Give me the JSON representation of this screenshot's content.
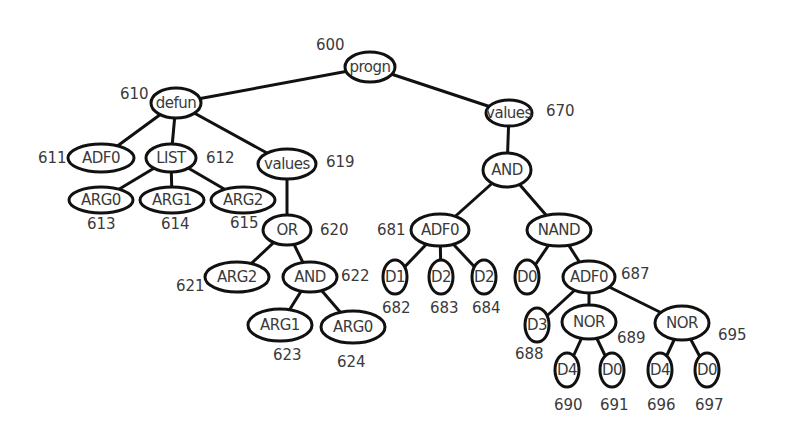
{
  "diagram": {
    "type": "tree",
    "nodes": [
      {
        "id": "n600",
        "label": "progn",
        "ref": "600",
        "x": 370,
        "y": 67,
        "rx": 25,
        "ry": 15,
        "ref_x": 316,
        "ref_y": 45
      },
      {
        "id": "n610",
        "label": "defun",
        "ref": "610",
        "x": 176,
        "y": 103,
        "rx": 25,
        "ry": 15,
        "ref_x": 120,
        "ref_y": 94
      },
      {
        "id": "n611",
        "label": "ADF0",
        "ref": "611",
        "x": 101,
        "y": 158,
        "rx": 33,
        "ry": 14,
        "ref_x": 38,
        "ref_y": 158
      },
      {
        "id": "n612",
        "label": "LIST",
        "ref": "612",
        "x": 171,
        "y": 158,
        "rx": 25,
        "ry": 14,
        "ref_x": 206,
        "ref_y": 158
      },
      {
        "id": "n613",
        "label": "ARG0",
        "ref": "613",
        "x": 101,
        "y": 200,
        "rx": 32,
        "ry": 13,
        "ref_x": 87,
        "ref_y": 224
      },
      {
        "id": "n614",
        "label": "ARG1",
        "ref": "614",
        "x": 172,
        "y": 200,
        "rx": 32,
        "ry": 13,
        "ref_x": 161,
        "ref_y": 224
      },
      {
        "id": "n615",
        "label": "ARG2",
        "ref": "615",
        "x": 243,
        "y": 200,
        "rx": 32,
        "ry": 13,
        "ref_x": 230,
        "ref_y": 223
      },
      {
        "id": "n619",
        "label": "values",
        "ref": "619",
        "x": 287,
        "y": 164,
        "rx": 29,
        "ry": 15,
        "ref_x": 326,
        "ref_y": 162
      },
      {
        "id": "n620",
        "label": "OR",
        "ref": "620",
        "x": 287,
        "y": 230,
        "rx": 24,
        "ry": 15,
        "ref_x": 320,
        "ref_y": 230
      },
      {
        "id": "n621",
        "label": "ARG2",
        "ref": "621",
        "x": 237,
        "y": 277,
        "rx": 32,
        "ry": 15,
        "ref_x": 176,
        "ref_y": 286
      },
      {
        "id": "n622",
        "label": "AND",
        "ref": "622",
        "x": 310,
        "y": 277,
        "rx": 27,
        "ry": 15,
        "ref_x": 341,
        "ref_y": 276
      },
      {
        "id": "n623",
        "label": "ARG1",
        "ref": "623",
        "x": 280,
        "y": 325,
        "rx": 32,
        "ry": 16,
        "ref_x": 273,
        "ref_y": 355
      },
      {
        "id": "n624",
        "label": "ARG0",
        "ref": "624",
        "x": 353,
        "y": 327,
        "rx": 32,
        "ry": 16,
        "ref_x": 337,
        "ref_y": 362
      },
      {
        "id": "n670",
        "label": "values",
        "ref": "670",
        "x": 509,
        "y": 113,
        "rx": 23,
        "ry": 13,
        "ref_x": 546,
        "ref_y": 111
      },
      {
        "id": "n680",
        "label": "AND",
        "ref": "",
        "x": 507,
        "y": 170,
        "rx": 24,
        "ry": 17,
        "ref_x": 0,
        "ref_y": 0
      },
      {
        "id": "n681",
        "label": "ADF0",
        "ref": "681",
        "x": 440,
        "y": 230,
        "rx": 29,
        "ry": 16,
        "ref_x": 377,
        "ref_y": 230
      },
      {
        "id": "n682",
        "label": "D1",
        "ref": "682",
        "x": 395,
        "y": 277,
        "rx": 12,
        "ry": 17,
        "ref_x": 382,
        "ref_y": 308
      },
      {
        "id": "n683",
        "label": "D2",
        "ref": "683",
        "x": 441,
        "y": 277,
        "rx": 12,
        "ry": 17,
        "ref_x": 430,
        "ref_y": 308
      },
      {
        "id": "n684",
        "label": "D2",
        "ref": "684",
        "x": 484,
        "y": 277,
        "rx": 12,
        "ry": 17,
        "ref_x": 472,
        "ref_y": 308
      },
      {
        "id": "n685",
        "label": "NAND",
        "ref": "",
        "x": 559,
        "y": 230,
        "rx": 32,
        "ry": 16,
        "ref_x": 0,
        "ref_y": 0
      },
      {
        "id": "n686",
        "label": "D0",
        "ref": "",
        "x": 527,
        "y": 277,
        "rx": 12,
        "ry": 17,
        "ref_x": 0,
        "ref_y": 0
      },
      {
        "id": "n687",
        "label": "ADF0",
        "ref": "687",
        "x": 589,
        "y": 277,
        "rx": 26,
        "ry": 16,
        "ref_x": 621,
        "ref_y": 274
      },
      {
        "id": "n688",
        "label": "D3",
        "ref": "688",
        "x": 537,
        "y": 325,
        "rx": 12,
        "ry": 17,
        "ref_x": 515,
        "ref_y": 354
      },
      {
        "id": "n689",
        "label": "NOR",
        "ref": "689",
        "x": 589,
        "y": 322,
        "rx": 27,
        "ry": 17,
        "ref_x": 617,
        "ref_y": 338
      },
      {
        "id": "n690",
        "label": "D4",
        "ref": "690",
        "x": 567,
        "y": 370,
        "rx": 12,
        "ry": 17,
        "ref_x": 554,
        "ref_y": 405
      },
      {
        "id": "n691",
        "label": "D0",
        "ref": "691",
        "x": 612,
        "y": 370,
        "rx": 12,
        "ry": 17,
        "ref_x": 600,
        "ref_y": 405
      },
      {
        "id": "n695",
        "label": "NOR",
        "ref": "695",
        "x": 682,
        "y": 323,
        "rx": 27,
        "ry": 17,
        "ref_x": 718,
        "ref_y": 335
      },
      {
        "id": "n696",
        "label": "D4",
        "ref": "696",
        "x": 660,
        "y": 370,
        "rx": 12,
        "ry": 17,
        "ref_x": 647,
        "ref_y": 405
      },
      {
        "id": "n697",
        "label": "D0",
        "ref": "697",
        "x": 707,
        "y": 370,
        "rx": 12,
        "ry": 17,
        "ref_x": 695,
        "ref_y": 405
      }
    ],
    "edges": [
      [
        "n600",
        "n610"
      ],
      [
        "n600",
        "n670"
      ],
      [
        "n610",
        "n611"
      ],
      [
        "n610",
        "n612"
      ],
      [
        "n610",
        "n619"
      ],
      [
        "n612",
        "n613"
      ],
      [
        "n612",
        "n614"
      ],
      [
        "n612",
        "n615"
      ],
      [
        "n619",
        "n620"
      ],
      [
        "n620",
        "n621"
      ],
      [
        "n620",
        "n622"
      ],
      [
        "n622",
        "n623"
      ],
      [
        "n622",
        "n624"
      ],
      [
        "n670",
        "n680"
      ],
      [
        "n680",
        "n681"
      ],
      [
        "n680",
        "n685"
      ],
      [
        "n681",
        "n682"
      ],
      [
        "n681",
        "n683"
      ],
      [
        "n681",
        "n684"
      ],
      [
        "n685",
        "n686"
      ],
      [
        "n685",
        "n687"
      ],
      [
        "n687",
        "n688"
      ],
      [
        "n687",
        "n689"
      ],
      [
        "n687",
        "n695"
      ],
      [
        "n689",
        "n690"
      ],
      [
        "n689",
        "n691"
      ],
      [
        "n695",
        "n696"
      ],
      [
        "n695",
        "n697"
      ]
    ]
  }
}
